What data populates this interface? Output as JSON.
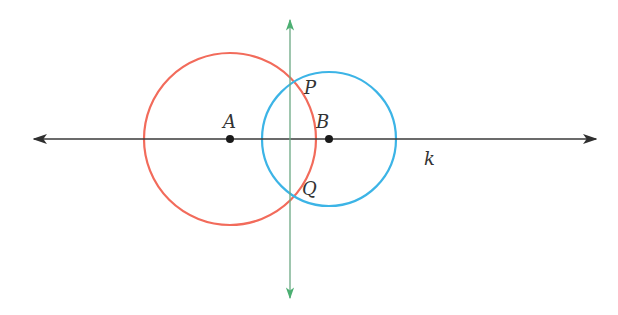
{
  "diagram": {
    "type": "geometric-construction",
    "line_k": {
      "label": "k",
      "color": "#3a3a3a",
      "y": 139,
      "x_start": 33,
      "x_end": 597,
      "arrows": "both"
    },
    "perpendicular_line": {
      "color": "#4caf72",
      "x": 290,
      "y_start": 19,
      "y_end": 299,
      "arrows": "both"
    },
    "circles": [
      {
        "name": "circle-a",
        "center": "A",
        "cx": 230,
        "cy": 139,
        "r": 86,
        "color": "#f26b5b"
      },
      {
        "name": "circle-b",
        "center": "B",
        "cx": 329,
        "cy": 139,
        "r": 67,
        "color": "#3cb4e6"
      }
    ],
    "points": [
      {
        "name": "A",
        "label": "A",
        "x": 230,
        "y": 139,
        "dot": true
      },
      {
        "name": "B",
        "label": "B",
        "x": 329,
        "y": 139,
        "dot": true
      },
      {
        "name": "P",
        "label": "P",
        "x": 290,
        "y": 78,
        "dot": false
      },
      {
        "name": "Q",
        "label": "Q",
        "x": 290,
        "y": 199,
        "dot": false
      }
    ],
    "labels": {
      "A": "A",
      "B": "B",
      "P": "P",
      "Q": "Q",
      "k": "k"
    }
  }
}
